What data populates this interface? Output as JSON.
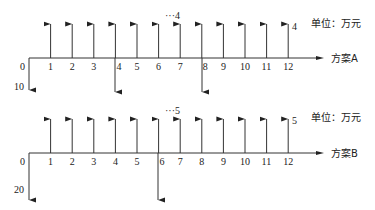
{
  "diagram": {
    "type": "cash-flow-diagram",
    "unit_label": "单位：万元",
    "plans": [
      {
        "name": "方案A",
        "periods": [
          "0",
          "1",
          "2",
          "3",
          "4",
          "5",
          "6",
          "7",
          "8",
          "9",
          "10",
          "11",
          "12"
        ],
        "initial_outflow": "10",
        "annual_inflow": "4",
        "inflow_label_mid": "···4",
        "inflow_label_end": "4",
        "outflow_periods": [
          0,
          4,
          8
        ]
      },
      {
        "name": "方案B",
        "periods": [
          "0",
          "1",
          "2",
          "3",
          "4",
          "5",
          "6",
          "7",
          "8",
          "9",
          "10",
          "11",
          "12"
        ],
        "initial_outflow": "20",
        "annual_inflow": "5",
        "inflow_label_mid": "···5",
        "inflow_label_end": "5",
        "outflow_periods": [
          0,
          6
        ]
      }
    ]
  }
}
